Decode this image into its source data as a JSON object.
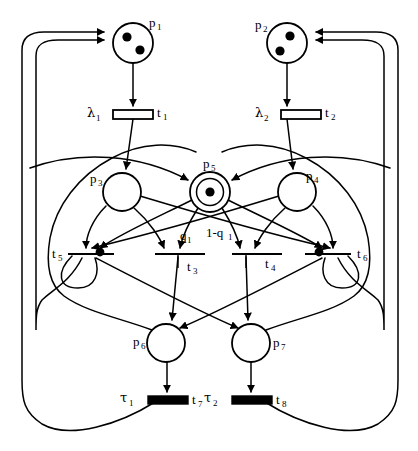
{
  "diagram": {
    "type": "petri-net",
    "width": 418,
    "height": 451,
    "stroke_color": "#000000",
    "fill_color": "#ffffff"
  },
  "places": [
    {
      "id": "p1",
      "label": "p",
      "sub": "1",
      "cx": 133,
      "cy": 43,
      "r": 20,
      "tokens": 2,
      "double": false,
      "label_dx": 16,
      "label_dy": -16
    },
    {
      "id": "p2",
      "label": "p",
      "sub": "2",
      "cx": 287,
      "cy": 43,
      "r": 20,
      "tokens": 2,
      "double": false,
      "label_dx": -32,
      "label_dy": -14
    },
    {
      "id": "p3",
      "label": "p",
      "sub": "3",
      "cx": 122,
      "cy": 192,
      "r": 19,
      "tokens": 0,
      "double": false,
      "label_dx": -32,
      "label_dy": -12
    },
    {
      "id": "p4",
      "label": "p",
      "sub": "4",
      "cx": 297,
      "cy": 192,
      "r": 19,
      "tokens": 0,
      "double": false,
      "label_dx": 14,
      "label_dy": -14
    },
    {
      "id": "p5",
      "label": "p",
      "sub": "5",
      "cx": 210,
      "cy": 192,
      "r": 20,
      "tokens": 1,
      "double": true,
      "label_dx": -5,
      "label_dy": -25
    },
    {
      "id": "p6",
      "label": "p",
      "sub": "6",
      "cx": 166,
      "cy": 343,
      "r": 19,
      "tokens": 0,
      "double": false,
      "label_dx": -33,
      "label_dy": 3
    },
    {
      "id": "p7",
      "label": "p",
      "sub": "7",
      "cx": 251,
      "cy": 343,
      "r": 19,
      "tokens": 0,
      "double": false,
      "label_dx": 16,
      "label_dy": 4
    }
  ],
  "transitions": [
    {
      "id": "t1",
      "label": "t",
      "sub": "1",
      "rate_label": "λ",
      "rate_sub": "1",
      "x": 113,
      "y": 110,
      "w": 40,
      "h": 9,
      "kind": "timed-hollow",
      "label_dx": 45,
      "label_dy": 5,
      "rate_dx": -26,
      "rate_dy": 5
    },
    {
      "id": "t2",
      "label": "t",
      "sub": "2",
      "rate_label": "λ",
      "rate_sub": "2",
      "x": 281,
      "y": 110,
      "w": 40,
      "h": 9,
      "kind": "timed-hollow",
      "label_dx": 45,
      "label_dy": 5,
      "rate_dx": -26,
      "rate_dy": 5
    },
    {
      "id": "t3",
      "label": "t",
      "sub": "3",
      "x": 155,
      "y": 253,
      "w": 50,
      "h": 2,
      "kind": "immediate-line",
      "label_dx": 55,
      "label_dy": 12,
      "weight": "q",
      "weight_sub": "1"
    },
    {
      "id": "t4",
      "label": "t",
      "sub": "4",
      "x": 232,
      "y": 253,
      "w": 50,
      "h": 2,
      "kind": "immediate-line",
      "label_dx": 55,
      "label_dy": 12,
      "weight": "1-q",
      "weight_sub": "1"
    },
    {
      "id": "t5",
      "label": "t",
      "sub": "5",
      "x": 68,
      "y": 253,
      "w": 46,
      "h": 2,
      "kind": "immediate-line",
      "label_dx": -16,
      "label_dy": -1,
      "inhibitor_dot": true
    },
    {
      "id": "t6",
      "label": "t",
      "sub": "6",
      "x": 305,
      "y": 253,
      "w": 46,
      "h": 2,
      "kind": "immediate-line",
      "label_dx": 52,
      "label_dy": 0,
      "inhibitor_dot": true
    },
    {
      "id": "t7",
      "label": "t",
      "sub": "7",
      "rate_label": "τ",
      "rate_sub": "1",
      "x": 148,
      "y": 396,
      "w": 40,
      "h": 8,
      "kind": "timed-filled",
      "label_dx": 46,
      "label_dy": 6,
      "rate_dx": -28,
      "rate_dy": 5
    },
    {
      "id": "t8",
      "label": "t",
      "sub": "8",
      "rate_label": "τ",
      "rate_sub": "2",
      "x": 232,
      "y": 396,
      "w": 40,
      "h": 8,
      "kind": "timed-filled",
      "label_dx": 46,
      "label_dy": 6,
      "rate_dx": -28,
      "rate_dy": 5
    }
  ],
  "arc_labels": [
    {
      "id": "q1",
      "text": "q",
      "sub": "1",
      "x": 180,
      "y": 237
    },
    {
      "id": "1-q1",
      "text": "1-q",
      "sub": "1",
      "x": 209,
      "y": 234
    }
  ],
  "legend": {
    "note": ""
  }
}
